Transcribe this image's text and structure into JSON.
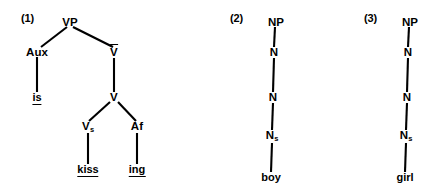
{
  "figure": {
    "background_color": "#ffffff",
    "ink_color": "#000000",
    "trees": [
      {
        "number_label": "(1)",
        "type": "branching-tree",
        "nodes": [
          {
            "id": "vp",
            "label": "VP",
            "subscript": "",
            "overbar": false
          },
          {
            "id": "aux",
            "label": "Aux",
            "subscript": "",
            "overbar": false
          },
          {
            "id": "vbar",
            "label": "V",
            "subscript": "",
            "overbar": true
          },
          {
            "id": "v",
            "label": "V",
            "subscript": "",
            "overbar": false
          },
          {
            "id": "vs",
            "label": "V",
            "subscript": "s",
            "overbar": false
          },
          {
            "id": "af",
            "label": "Af",
            "subscript": "",
            "overbar": false
          }
        ],
        "terminals": [
          {
            "id": "is",
            "text": "is",
            "underlined": true
          },
          {
            "id": "kiss",
            "text": "kiss",
            "underlined": true
          },
          {
            "id": "ing",
            "text": "ing",
            "underlined": true
          }
        ]
      },
      {
        "number_label": "(2)",
        "type": "linear-chain",
        "nodes": [
          {
            "id": "np",
            "label": "NP",
            "subscript": "",
            "overbar": false
          },
          {
            "id": "n1",
            "label": "N",
            "subscript": "",
            "overbar": false
          },
          {
            "id": "n2",
            "label": "N",
            "subscript": "",
            "overbar": false
          },
          {
            "id": "ns",
            "label": "N",
            "subscript": "s",
            "overbar": false
          }
        ],
        "terminals": [
          {
            "id": "boy",
            "text": "boy",
            "underlined": false
          }
        ]
      },
      {
        "number_label": "(3)",
        "type": "linear-chain",
        "nodes": [
          {
            "id": "np",
            "label": "NP",
            "subscript": "",
            "overbar": false
          },
          {
            "id": "n1",
            "label": "N",
            "subscript": "",
            "overbar": false
          },
          {
            "id": "n2",
            "label": "N",
            "subscript": "",
            "overbar": false
          },
          {
            "id": "ns",
            "label": "N",
            "subscript": "s",
            "overbar": false
          }
        ],
        "terminals": [
          {
            "id": "girl",
            "text": "girl",
            "underlined": false
          }
        ]
      }
    ]
  }
}
